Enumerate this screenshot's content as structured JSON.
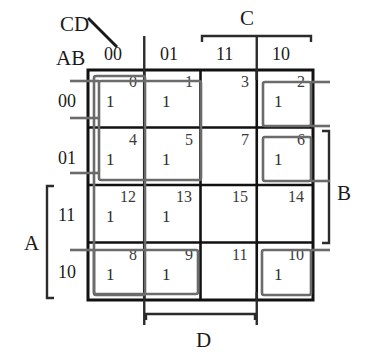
{
  "figure": {
    "type": "karnaugh-map",
    "variables": 4,
    "row_variable_label": "AB",
    "col_variable_label": "CD",
    "row_headers": [
      "00",
      "01",
      "11",
      "10"
    ],
    "col_headers": [
      "00",
      "01",
      "11",
      "10"
    ],
    "grid": {
      "left": 88,
      "top": 70,
      "right": 313,
      "bottom": 300
    }
  },
  "cells": [
    {
      "index": "0",
      "row": 0,
      "col": 0,
      "value": "1"
    },
    {
      "index": "1",
      "row": 0,
      "col": 1,
      "value": "1"
    },
    {
      "index": "3",
      "row": 0,
      "col": 2,
      "value": ""
    },
    {
      "index": "2",
      "row": 0,
      "col": 3,
      "value": "1"
    },
    {
      "index": "4",
      "row": 1,
      "col": 0,
      "value": "1"
    },
    {
      "index": "5",
      "row": 1,
      "col": 1,
      "value": "1"
    },
    {
      "index": "7",
      "row": 1,
      "col": 2,
      "value": ""
    },
    {
      "index": "6",
      "row": 1,
      "col": 3,
      "value": "1"
    },
    {
      "index": "12",
      "row": 2,
      "col": 0,
      "value": "1"
    },
    {
      "index": "13",
      "row": 2,
      "col": 1,
      "value": "1"
    },
    {
      "index": "15",
      "row": 2,
      "col": 2,
      "value": ""
    },
    {
      "index": "14",
      "row": 2,
      "col": 3,
      "value": ""
    },
    {
      "index": "8",
      "row": 3,
      "col": 0,
      "value": "1"
    },
    {
      "index": "9",
      "row": 3,
      "col": 1,
      "value": "1"
    },
    {
      "index": "11",
      "row": 3,
      "col": 2,
      "value": ""
    },
    {
      "index": "10",
      "row": 3,
      "col": 3,
      "value": "1"
    }
  ],
  "brackets": {
    "top": {
      "label": "C",
      "spans": [
        "11",
        "10"
      ]
    },
    "bottom": {
      "label": "D",
      "spans": [
        "01",
        "11"
      ]
    },
    "left": {
      "label": "A",
      "spans": [
        "11",
        "10"
      ]
    },
    "right": {
      "label": "B",
      "spans": [
        "01",
        "11"
      ]
    }
  },
  "groups": [
    {
      "name": "column-00-full",
      "cells": [
        "0",
        "4",
        "12",
        "8"
      ]
    },
    {
      "name": "quad-0-1-4-5",
      "cells": [
        "0",
        "1",
        "4",
        "5"
      ]
    },
    {
      "name": "wrap-cell-2",
      "cells": [
        "2"
      ]
    },
    {
      "name": "wrap-cell-6",
      "cells": [
        "6"
      ]
    },
    {
      "name": "pair-8-9",
      "cells": [
        "8",
        "9"
      ]
    },
    {
      "name": "wrap-cell-10",
      "cells": [
        "10"
      ]
    }
  ],
  "colors": {
    "grid_line": "#111111",
    "group_loop": "#6b6b6b",
    "bracket": "#2b2b2b",
    "text": "#1a1a1a",
    "background": "#ffffff"
  }
}
